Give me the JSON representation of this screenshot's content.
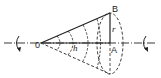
{
  "diagram": {
    "labels": {
      "apex": "0",
      "top_point": "B",
      "base_center": "A",
      "radius": "r",
      "height": "h"
    },
    "colors": {
      "line": "#222222",
      "background": "#ffffff"
    }
  }
}
